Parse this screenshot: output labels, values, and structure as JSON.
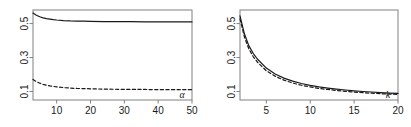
{
  "figure": {
    "background": "#ffffff",
    "line_color": "#1a1a1a",
    "axis_color": "#808080",
    "panels": 2
  },
  "chart_data": [
    {
      "type": "line",
      "panel": "left",
      "title": "",
      "xlabel": "α",
      "ylabel": "",
      "xlim": [
        3,
        50
      ],
      "ylim": [
        0.05,
        0.58
      ],
      "xticks": [
        10,
        20,
        30,
        40,
        50
      ],
      "xticklabels": [
        "10",
        "20",
        "30",
        "40",
        "50"
      ],
      "yticks": [
        0.1,
        0.3,
        0.5
      ],
      "yticklabels": [
        "0.1",
        "0.3",
        "0.5"
      ],
      "grid": false,
      "legend": "none",
      "series": [
        {
          "name": "solid",
          "style": "solid",
          "color": "#1a1a1a",
          "x": [
            3,
            4,
            5,
            6,
            7,
            8,
            9,
            10,
            12,
            14,
            16,
            18,
            20,
            24,
            28,
            32,
            36,
            40,
            45,
            50
          ],
          "values": [
            0.562,
            0.549,
            0.54,
            0.534,
            0.529,
            0.526,
            0.523,
            0.521,
            0.518,
            0.516,
            0.515,
            0.514,
            0.513,
            0.512,
            0.511,
            0.511,
            0.51,
            0.51,
            0.51,
            0.51
          ]
        },
        {
          "name": "dashed",
          "style": "dashed",
          "color": "#1a1a1a",
          "x": [
            3,
            4,
            5,
            6,
            7,
            8,
            9,
            10,
            12,
            14,
            16,
            18,
            20,
            24,
            28,
            32,
            36,
            40,
            45,
            50
          ],
          "values": [
            0.171,
            0.158,
            0.149,
            0.142,
            0.137,
            0.133,
            0.13,
            0.127,
            0.123,
            0.12,
            0.118,
            0.117,
            0.116,
            0.114,
            0.113,
            0.112,
            0.112,
            0.111,
            0.111,
            0.111
          ]
        }
      ]
    },
    {
      "type": "line",
      "panel": "right",
      "title": "",
      "xlabel": "k",
      "ylabel": "",
      "xlim": [
        2,
        20
      ],
      "ylim": [
        0.05,
        0.58
      ],
      "xticks": [
        5,
        10,
        15,
        20
      ],
      "xticklabels": [
        "5",
        "10",
        "15",
        "20"
      ],
      "yticks": [
        0.1,
        0.3,
        0.5
      ],
      "yticklabels": [
        "0.1",
        "0.3",
        "0.5"
      ],
      "grid": false,
      "legend": "none",
      "series": [
        {
          "name": "solid",
          "style": "solid",
          "color": "#1a1a1a",
          "x": [
            2,
            2.5,
            3,
            3.5,
            4,
            5,
            6,
            7,
            8,
            9,
            10,
            11,
            12,
            13,
            14,
            15,
            16,
            17,
            18,
            19,
            20
          ],
          "values": [
            0.545,
            0.44,
            0.37,
            0.325,
            0.29,
            0.238,
            0.203,
            0.179,
            0.161,
            0.147,
            0.136,
            0.127,
            0.12,
            0.114,
            0.109,
            0.104,
            0.1,
            0.097,
            0.094,
            0.091,
            0.089
          ]
        },
        {
          "name": "dashed",
          "style": "dashed",
          "color": "#1a1a1a",
          "x": [
            2,
            2.5,
            3,
            3.5,
            4,
            5,
            6,
            7,
            8,
            9,
            10,
            11,
            12,
            13,
            14,
            15,
            16,
            17,
            18,
            19,
            20
          ],
          "values": [
            0.528,
            0.422,
            0.352,
            0.306,
            0.272,
            0.222,
            0.19,
            0.167,
            0.15,
            0.137,
            0.127,
            0.118,
            0.112,
            0.106,
            0.101,
            0.097,
            0.093,
            0.09,
            0.087,
            0.085,
            0.083
          ]
        }
      ]
    }
  ],
  "left_panel": {
    "xlabel": "α",
    "xticklabels": [
      "10",
      "20",
      "30",
      "40",
      "50"
    ],
    "yticklabels": [
      "0.1",
      "0.3",
      "0.5"
    ]
  },
  "right_panel": {
    "xlabel": "k",
    "xticklabels": [
      "5",
      "10",
      "15",
      "20"
    ],
    "yticklabels": [
      "0.1",
      "0.3",
      "0.5"
    ]
  }
}
